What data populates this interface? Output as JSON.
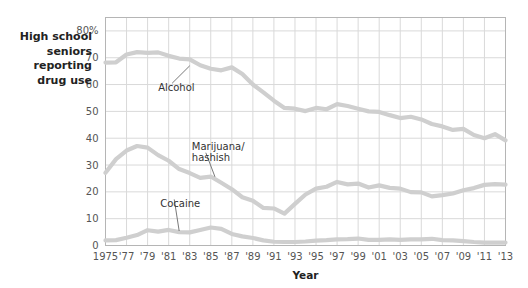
{
  "caption": {
    "lines": [
      "High school",
      "seniors",
      "reporting",
      "drug use"
    ]
  },
  "colors": {
    "series_line": "#cfcfcf",
    "grid": "#d9d9d9",
    "axis": "#b5b5b5",
    "text": "#333333",
    "background": "#ffffff",
    "annotation_leader": "#6a6a6a"
  },
  "chart_data": {
    "type": "line",
    "xlabel": "Year",
    "ylabel": "",
    "xlim": [
      1975,
      2013
    ],
    "ylim": [
      0,
      85
    ],
    "grid": true,
    "legend_position": "inline-annotations",
    "x_tick_labels": [
      "1975",
      "'77",
      "'79",
      "'81",
      "'83",
      "'85",
      "'87",
      "'89",
      "'91",
      "'93",
      "'95",
      "'97",
      "'99",
      "'01",
      "'03",
      "'05",
      "'07",
      "'09",
      "'11",
      "'13"
    ],
    "x_tick_values": [
      1975,
      1977,
      1979,
      1981,
      1983,
      1985,
      1987,
      1989,
      1991,
      1993,
      1995,
      1997,
      1999,
      2001,
      2003,
      2005,
      2007,
      2009,
      2011,
      2013
    ],
    "y_tick_labels": [
      "0",
      "10",
      "20",
      "30",
      "40",
      "50",
      "60",
      "70",
      "80%"
    ],
    "y_tick_values": [
      0,
      10,
      20,
      30,
      40,
      50,
      60,
      70,
      80
    ],
    "x": [
      1975,
      1976,
      1977,
      1978,
      1979,
      1980,
      1981,
      1982,
      1983,
      1984,
      1985,
      1986,
      1987,
      1988,
      1989,
      1990,
      1991,
      1992,
      1993,
      1994,
      1995,
      1996,
      1997,
      1998,
      1999,
      2000,
      2001,
      2002,
      2003,
      2004,
      2005,
      2006,
      2007,
      2008,
      2009,
      2010,
      2011,
      2012,
      2013
    ],
    "series": [
      {
        "name": "Alcohol",
        "values": [
          68.2,
          68.3,
          71.2,
          72.1,
          71.8,
          72.0,
          70.7,
          69.7,
          69.4,
          67.2,
          65.9,
          65.3,
          66.4,
          63.9,
          60.0,
          57.1,
          54.0,
          51.3,
          51.0,
          50.1,
          51.3,
          50.8,
          52.7,
          52.0,
          51.0,
          50.0,
          49.8,
          48.6,
          47.5,
          48.0,
          47.0,
          45.3,
          44.4,
          43.1,
          43.5,
          41.2,
          40.0,
          41.5,
          39.2
        ]
      },
      {
        "name": "Marijuana/hashish",
        "values": [
          27.1,
          32.2,
          35.4,
          37.1,
          36.5,
          33.7,
          31.6,
          28.5,
          27.0,
          25.2,
          25.7,
          23.4,
          21.0,
          18.0,
          16.7,
          14.0,
          13.8,
          11.9,
          15.5,
          19.0,
          21.2,
          21.9,
          23.7,
          22.8,
          23.1,
          21.6,
          22.4,
          21.5,
          21.2,
          19.9,
          19.8,
          18.3,
          18.8,
          19.4,
          20.6,
          21.4,
          22.6,
          22.9,
          22.7
        ]
      },
      {
        "name": "Cocaine",
        "values": [
          1.9,
          2.0,
          2.9,
          3.9,
          5.7,
          5.2,
          5.8,
          5.0,
          4.9,
          5.8,
          6.7,
          6.2,
          4.3,
          3.4,
          2.8,
          1.9,
          1.4,
          1.3,
          1.3,
          1.5,
          1.8,
          2.0,
          2.3,
          2.4,
          2.6,
          2.1,
          2.1,
          2.3,
          2.1,
          2.3,
          2.3,
          2.5,
          2.0,
          1.9,
          1.6,
          1.3,
          1.1,
          1.1,
          1.1
        ]
      }
    ],
    "annotations": [
      {
        "label": "Alcohol",
        "text_x": 1980.0,
        "text_y": 57.5,
        "point_x": 1983.0,
        "point_y": 67.0
      },
      {
        "label": "Marijuana/",
        "text_x": 1983.2,
        "text_y": 35.5,
        "point_x": 0,
        "point_y": 0
      },
      {
        "label": "hashish",
        "text_x": 1983.2,
        "text_y": 31.6,
        "point_x": 1985.4,
        "point_y": 25.6
      },
      {
        "label": "Cocaine",
        "text_x": 1980.2,
        "text_y": 14.2,
        "point_x": 1982.0,
        "point_y": 5.4
      }
    ]
  },
  "xaxis_title": "Year"
}
